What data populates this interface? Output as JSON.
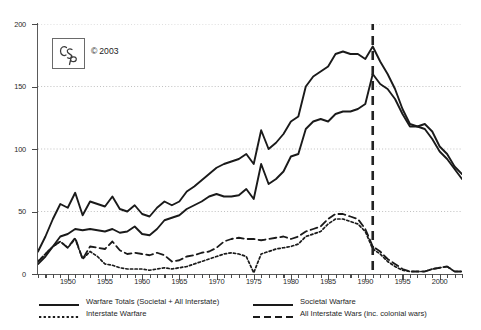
{
  "logo": {
    "mark": "CSp",
    "copyright_symbol": "©",
    "copyright_year": "2003"
  },
  "legend": {
    "items": [
      {
        "label": "Warfare Totals (Societal + All Interstate)",
        "style": "solid-thick",
        "color": "#1a1a1a"
      },
      {
        "label": "Societal Warfare",
        "style": "solid-thick",
        "color": "#1a1a1a"
      },
      {
        "label": "Interstate Warfare",
        "style": "dotted",
        "color": "#1a1a1a"
      },
      {
        "label": "All Interstate Wars (inc. colonial wars)",
        "style": "dashed",
        "color": "#1a1a1a"
      }
    ]
  },
  "chart_data": {
    "type": "line",
    "title": "",
    "xlabel": "",
    "ylabel": "",
    "xlim": [
      1946,
      2003
    ],
    "ylim": [
      0,
      200
    ],
    "ytick_values": [
      0,
      50,
      100,
      150,
      200
    ],
    "ytick_labels": [
      "0",
      "50",
      "100",
      "150",
      "200"
    ],
    "xtick_values": [
      1950,
      1955,
      1960,
      1965,
      1970,
      1975,
      1980,
      1985,
      1990,
      1995,
      2000
    ],
    "xtick_labels": [
      "1950",
      "1955",
      "1960",
      "1965",
      "1970",
      "1975",
      "1980",
      "1985",
      "1990",
      "1995",
      "2000"
    ],
    "xtick_minor_step": 1,
    "grid": "horizontal-dotted",
    "legend_position": "below-plot",
    "annotations": [
      {
        "type": "vline",
        "x": 1991,
        "style": "dashed",
        "color": "#222222",
        "width": 2.6
      }
    ],
    "x": [
      1946,
      1947,
      1948,
      1949,
      1950,
      1951,
      1952,
      1953,
      1954,
      1955,
      1956,
      1957,
      1958,
      1959,
      1960,
      1961,
      1962,
      1963,
      1964,
      1965,
      1966,
      1967,
      1968,
      1969,
      1970,
      1971,
      1972,
      1973,
      1974,
      1975,
      1976,
      1977,
      1978,
      1979,
      1980,
      1981,
      1982,
      1983,
      1984,
      1985,
      1986,
      1987,
      1988,
      1989,
      1990,
      1991,
      1992,
      1993,
      1994,
      1995,
      1996,
      1997,
      1998,
      1999,
      2000,
      2001,
      2002,
      2003
    ],
    "series": [
      {
        "name": "Warfare Totals (Societal + All Interstate)",
        "style": "solid-thick",
        "color": "#1a1a1a",
        "values": [
          18,
          30,
          44,
          56,
          53,
          65,
          47,
          58,
          56,
          54,
          62,
          52,
          50,
          55,
          48,
          46,
          53,
          58,
          55,
          58,
          66,
          70,
          75,
          80,
          85,
          88,
          90,
          92,
          96,
          88,
          115,
          100,
          105,
          112,
          122,
          126,
          150,
          158,
          162,
          166,
          176,
          178,
          176,
          176,
          172,
          182,
          170,
          160,
          148,
          132,
          120,
          118,
          116,
          108,
          98,
          92,
          84,
          76
        ]
      },
      {
        "name": "Societal Warfare",
        "style": "solid-thick",
        "color": "#1a1a1a",
        "values": [
          8,
          14,
          22,
          30,
          32,
          36,
          35,
          36,
          35,
          34,
          36,
          33,
          34,
          38,
          32,
          31,
          36,
          43,
          45,
          47,
          52,
          55,
          58,
          62,
          64,
          62,
          62,
          63,
          68,
          60,
          88,
          72,
          76,
          82,
          94,
          96,
          116,
          122,
          124,
          122,
          128,
          130,
          130,
          132,
          136,
          160,
          152,
          148,
          140,
          128,
          118,
          118,
          120,
          114,
          102,
          96,
          86,
          80
        ]
      },
      {
        "name": "All Interstate Wars (inc. colonial wars)",
        "style": "dashed",
        "color": "#1a1a1a",
        "values": [
          10,
          16,
          22,
          26,
          21,
          29,
          12,
          22,
          21,
          20,
          26,
          19,
          16,
          17,
          16,
          15,
          17,
          15,
          10,
          11,
          14,
          15,
          17,
          18,
          21,
          26,
          28,
          29,
          28,
          28,
          27,
          28,
          29,
          30,
          28,
          30,
          34,
          36,
          38,
          44,
          48,
          48,
          46,
          44,
          36,
          22,
          18,
          12,
          8,
          4,
          2,
          2,
          2,
          4,
          5,
          6,
          2,
          2
        ]
      },
      {
        "name": "Interstate Warfare",
        "style": "dotted",
        "color": "#1a1a1a",
        "values": [
          10,
          16,
          22,
          26,
          21,
          28,
          12,
          18,
          14,
          8,
          7,
          5,
          4,
          4,
          4,
          3,
          4,
          5,
          4,
          5,
          6,
          8,
          10,
          12,
          14,
          16,
          17,
          16,
          14,
          1,
          16,
          18,
          20,
          21,
          22,
          24,
          30,
          32,
          34,
          40,
          44,
          44,
          42,
          40,
          34,
          20,
          16,
          10,
          6,
          3,
          2,
          2,
          2,
          4,
          5,
          6,
          2,
          2
        ]
      }
    ]
  }
}
